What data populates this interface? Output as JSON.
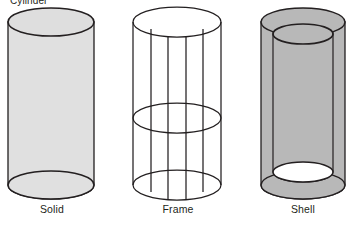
{
  "figure": {
    "title": "Cylinder",
    "title_clipped": true,
    "background_color": "#ffffff",
    "outline_color": "#231f20",
    "text_color": "#231f20"
  },
  "diagram": {
    "type": "3d-geometry-variants",
    "subject": "cylinder",
    "item_count": 3,
    "items": [
      {
        "id": "solid",
        "caption": "Solid",
        "fill_color": "#e0e0e0",
        "top_face_color": "#dedede",
        "stroke_color": "#231f20",
        "description": "Filled cylinder with opaque light gray surface and visible bottom rim",
        "geometry": {
          "center_x": 51,
          "top_y": 22,
          "bottom_y": 185,
          "radius_x": 43,
          "radius_y": 14
        }
      },
      {
        "id": "frame",
        "caption": "Frame",
        "fill_color": "none",
        "stroke_color": "#231f20",
        "description": "Wireframe cylinder with top, middle and bottom ellipses and six vertical edge lines",
        "geometry": {
          "center_x": 177,
          "top_y": 22,
          "bottom_y": 185,
          "radius_x": 44,
          "radius_y": 15,
          "middle_y": 118,
          "vertical_lines": 6
        }
      },
      {
        "id": "shell",
        "caption": "Shell",
        "fill_color": "#b8b8b8",
        "inner_cavity_color": "#ffffff",
        "stroke_color": "#231f20",
        "description": "Hollow tube with annular top ring, visible inner wall and white cavity at the bottom opening",
        "geometry": {
          "center_x": 303,
          "top_y": 22,
          "bottom_y": 185,
          "outer_radius_x": 42,
          "outer_radius_y": 14,
          "inner_radius_x": 30,
          "inner_radius_y": 10,
          "inner_top_y": 34,
          "inner_bottom_y": 172
        }
      }
    ]
  }
}
